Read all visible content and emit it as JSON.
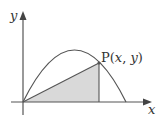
{
  "diagram": {
    "type": "function-graph",
    "axes": {
      "x_label": "x",
      "y_label": "y"
    },
    "curve": {
      "kind": "downward-parabola",
      "roots": [
        "origin",
        "right-root"
      ]
    },
    "point": {
      "name": "P",
      "label": "P(x, y)",
      "label_parts": {
        "name": "P",
        "open": "(",
        "x": "x",
        "sep": ", ",
        "y": "y",
        "close": ")"
      }
    },
    "shaded_region": "triangle from origin to P to foot of perpendicular on x-axis",
    "colors": {
      "line": "#555555",
      "shade": "#d9d9d9",
      "background": "#ffffff"
    }
  }
}
